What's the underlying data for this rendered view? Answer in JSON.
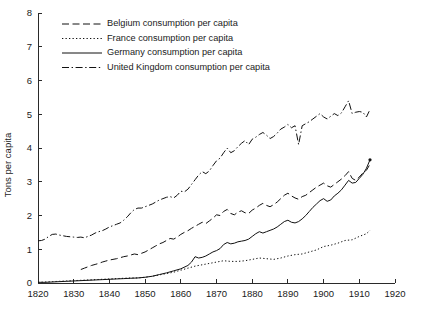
{
  "chart_data": {
    "type": "line",
    "title": "",
    "xlabel": "",
    "ylabel": "Tons per capita",
    "xlim": [
      1820,
      1920
    ],
    "ylim": [
      0,
      8
    ],
    "xticks": [
      1820,
      1830,
      1840,
      1850,
      1860,
      1870,
      1880,
      1890,
      1900,
      1910,
      1920
    ],
    "yticks": [
      0,
      1,
      2,
      3,
      4,
      5,
      6,
      7,
      8
    ],
    "grid": false,
    "legend_position": "top-left",
    "series": [
      {
        "name": "Belgium  consumption per capita",
        "style": "dashed",
        "color": "#111111",
        "x": [
          1832,
          1833,
          1834,
          1835,
          1836,
          1837,
          1838,
          1839,
          1840,
          1841,
          1842,
          1843,
          1844,
          1845,
          1846,
          1847,
          1848,
          1849,
          1850,
          1851,
          1852,
          1853,
          1854,
          1855,
          1856,
          1857,
          1858,
          1859,
          1860,
          1861,
          1862,
          1863,
          1864,
          1865,
          1866,
          1867,
          1868,
          1869,
          1870,
          1871,
          1872,
          1873,
          1874,
          1875,
          1876,
          1877,
          1878,
          1879,
          1880,
          1881,
          1882,
          1883,
          1884,
          1885,
          1886,
          1887,
          1888,
          1889,
          1890,
          1891,
          1892,
          1893,
          1894,
          1895,
          1896,
          1897,
          1898,
          1899,
          1900,
          1901,
          1902,
          1903,
          1904,
          1905,
          1906,
          1907,
          1908,
          1909,
          1910,
          1911,
          1912,
          1913
        ],
        "values": [
          0.4,
          0.44,
          0.48,
          0.52,
          0.55,
          0.58,
          0.62,
          0.65,
          0.68,
          0.7,
          0.72,
          0.75,
          0.78,
          0.8,
          0.83,
          0.86,
          0.84,
          0.88,
          0.92,
          0.98,
          1.04,
          1.1,
          1.16,
          1.2,
          1.26,
          1.32,
          1.3,
          1.36,
          1.44,
          1.5,
          1.55,
          1.62,
          1.68,
          1.74,
          1.8,
          1.76,
          1.84,
          1.92,
          2.02,
          2.0,
          2.12,
          2.18,
          2.06,
          2.02,
          2.1,
          2.14,
          2.08,
          2.06,
          2.16,
          2.22,
          2.3,
          2.36,
          2.3,
          2.26,
          2.32,
          2.4,
          2.5,
          2.6,
          2.66,
          2.58,
          2.52,
          2.48,
          2.56,
          2.6,
          2.68,
          2.76,
          2.84,
          2.9,
          2.96,
          2.88,
          2.84,
          2.92,
          3.0,
          3.08,
          3.18,
          3.3,
          3.1,
          3.04,
          3.14,
          3.26,
          3.34,
          3.52
        ]
      },
      {
        "name": "France  consumption per capita",
        "style": "dotted",
        "color": "#111111",
        "x": [
          1820,
          1822,
          1824,
          1826,
          1828,
          1830,
          1832,
          1834,
          1836,
          1838,
          1840,
          1842,
          1844,
          1846,
          1848,
          1850,
          1852,
          1854,
          1856,
          1858,
          1860,
          1862,
          1864,
          1866,
          1868,
          1870,
          1872,
          1874,
          1876,
          1878,
          1880,
          1882,
          1884,
          1886,
          1888,
          1890,
          1892,
          1894,
          1896,
          1898,
          1900,
          1902,
          1904,
          1906,
          1908,
          1910,
          1912,
          1913
        ],
        "values": [
          0.02,
          0.03,
          0.04,
          0.05,
          0.06,
          0.07,
          0.08,
          0.09,
          0.1,
          0.11,
          0.12,
          0.13,
          0.14,
          0.15,
          0.15,
          0.17,
          0.2,
          0.24,
          0.28,
          0.32,
          0.38,
          0.44,
          0.5,
          0.54,
          0.58,
          0.62,
          0.66,
          0.64,
          0.64,
          0.66,
          0.7,
          0.74,
          0.72,
          0.7,
          0.74,
          0.8,
          0.84,
          0.86,
          0.92,
          0.98,
          1.08,
          1.12,
          1.18,
          1.26,
          1.28,
          1.38,
          1.46,
          1.56
        ]
      },
      {
        "name": "Germany  consumption per capita",
        "style": "solid",
        "color": "#111111",
        "x": [
          1820,
          1822,
          1824,
          1826,
          1828,
          1830,
          1832,
          1834,
          1836,
          1838,
          1840,
          1842,
          1844,
          1846,
          1848,
          1850,
          1852,
          1854,
          1856,
          1858,
          1860,
          1862,
          1863,
          1864,
          1865,
          1866,
          1867,
          1868,
          1869,
          1870,
          1871,
          1872,
          1873,
          1874,
          1875,
          1876,
          1877,
          1878,
          1879,
          1880,
          1881,
          1882,
          1883,
          1884,
          1885,
          1886,
          1887,
          1888,
          1889,
          1890,
          1891,
          1892,
          1893,
          1894,
          1895,
          1896,
          1897,
          1898,
          1899,
          1900,
          1901,
          1902,
          1903,
          1904,
          1905,
          1906,
          1907,
          1908,
          1909,
          1910,
          1911,
          1912,
          1913
        ],
        "values": [
          0.02,
          0.02,
          0.03,
          0.04,
          0.05,
          0.06,
          0.07,
          0.08,
          0.09,
          0.1,
          0.11,
          0.12,
          0.13,
          0.14,
          0.15,
          0.17,
          0.2,
          0.25,
          0.3,
          0.36,
          0.42,
          0.52,
          0.62,
          0.78,
          0.74,
          0.76,
          0.8,
          0.86,
          0.92,
          0.96,
          1.02,
          1.14,
          1.2,
          1.16,
          1.18,
          1.22,
          1.24,
          1.26,
          1.3,
          1.38,
          1.46,
          1.52,
          1.48,
          1.52,
          1.56,
          1.6,
          1.66,
          1.74,
          1.82,
          1.86,
          1.8,
          1.78,
          1.82,
          1.9,
          2.0,
          2.12,
          2.24,
          2.34,
          2.44,
          2.5,
          2.42,
          2.46,
          2.58,
          2.66,
          2.76,
          2.9,
          3.04,
          2.96,
          2.98,
          3.1,
          3.22,
          3.4,
          3.65
        ]
      },
      {
        "name": "United Kingdom  consumption per capita",
        "style": "dashdot",
        "color": "#111111",
        "x": [
          1820,
          1821,
          1822,
          1823,
          1824,
          1825,
          1826,
          1827,
          1828,
          1829,
          1830,
          1831,
          1832,
          1833,
          1834,
          1835,
          1836,
          1837,
          1838,
          1839,
          1840,
          1841,
          1842,
          1843,
          1844,
          1845,
          1846,
          1847,
          1848,
          1849,
          1850,
          1851,
          1852,
          1853,
          1854,
          1855,
          1856,
          1857,
          1858,
          1859,
          1860,
          1861,
          1862,
          1863,
          1864,
          1865,
          1866,
          1867,
          1868,
          1869,
          1870,
          1871,
          1872,
          1873,
          1874,
          1875,
          1876,
          1877,
          1878,
          1879,
          1880,
          1881,
          1882,
          1883,
          1884,
          1885,
          1886,
          1887,
          1888,
          1889,
          1890,
          1891,
          1892,
          1893,
          1894,
          1895,
          1896,
          1897,
          1898,
          1899,
          1900,
          1901,
          1902,
          1903,
          1904,
          1905,
          1906,
          1907,
          1908,
          1909,
          1910,
          1911,
          1912,
          1913
        ],
        "values": [
          1.25,
          1.26,
          1.3,
          1.38,
          1.44,
          1.45,
          1.42,
          1.4,
          1.38,
          1.37,
          1.36,
          1.35,
          1.36,
          1.34,
          1.38,
          1.42,
          1.48,
          1.52,
          1.55,
          1.6,
          1.66,
          1.7,
          1.74,
          1.78,
          1.86,
          1.96,
          2.08,
          2.18,
          2.22,
          2.22,
          2.26,
          2.3,
          2.34,
          2.4,
          2.46,
          2.5,
          2.54,
          2.56,
          2.52,
          2.6,
          2.72,
          2.7,
          2.78,
          2.92,
          3.06,
          3.2,
          3.3,
          3.24,
          3.32,
          3.48,
          3.62,
          3.7,
          3.86,
          4.0,
          3.86,
          3.92,
          4.04,
          4.14,
          4.22,
          4.1,
          4.26,
          4.32,
          4.4,
          4.46,
          4.38,
          4.28,
          4.34,
          4.44,
          4.56,
          4.62,
          4.7,
          4.6,
          4.66,
          4.1,
          4.66,
          4.72,
          4.78,
          4.86,
          4.94,
          5.02,
          4.92,
          4.86,
          4.94,
          5.02,
          4.96,
          5.04,
          5.22,
          5.4,
          5.02,
          5.06,
          5.08,
          5.06,
          4.92,
          5.14
        ]
      }
    ]
  },
  "legend": {
    "items": [
      {
        "label": "Belgium  consumption per capita",
        "style": "dashed"
      },
      {
        "label": "France  consumption per capita",
        "style": "dotted"
      },
      {
        "label": "Germany  consumption per capita",
        "style": "solid"
      },
      {
        "label": "United Kingdom  consumption per capita",
        "style": "dashdot"
      }
    ]
  },
  "axes": {
    "y_title": "Tons per capita",
    "y_tick_labels": [
      "0",
      "1",
      "2",
      "3",
      "4",
      "5",
      "6",
      "7",
      "8"
    ],
    "x_tick_labels": [
      "1820",
      "1830",
      "1840",
      "1850",
      "1860",
      "1870",
      "1880",
      "1890",
      "1900",
      "1910",
      "1920"
    ]
  }
}
